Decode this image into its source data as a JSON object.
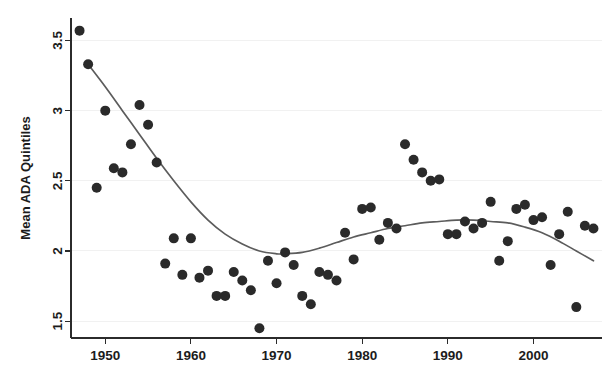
{
  "chart_data": {
    "type": "scatter",
    "title": "",
    "xlabel": "",
    "ylabel": "Mean ADA Quintiles",
    "xlim": [
      1946,
      2008
    ],
    "ylim": [
      1.38,
      3.66
    ],
    "xticks": [
      1950,
      1960,
      1970,
      1980,
      1990,
      2000
    ],
    "xtick_labels": [
      "1950",
      "1960",
      "1970",
      "1980",
      "1990",
      "2000"
    ],
    "yticks": [
      1.5,
      2,
      2.5,
      3,
      3.5
    ],
    "ytick_labels": [
      "1.5",
      "2",
      "2.5",
      "3",
      "3.5"
    ],
    "grid": true,
    "grid_axis": "y",
    "legend": "none",
    "marker_color": "#2a2a2a",
    "marker_size": 5.0,
    "fit_curve_color": "#5c5c5c",
    "fit_curve_label": "smoothed polynomial fit",
    "x": [
      1947,
      1948,
      1949,
      1950,
      1951,
      1952,
      1953,
      1954,
      1955,
      1956,
      1957,
      1958,
      1959,
      1960,
      1961,
      1962,
      1963,
      1964,
      1965,
      1966,
      1967,
      1968,
      1969,
      1970,
      1971,
      1972,
      1973,
      1974,
      1975,
      1976,
      1977,
      1978,
      1979,
      1980,
      1981,
      1982,
      1983,
      1984,
      1985,
      1986,
      1987,
      1988,
      1989,
      1990,
      1991,
      1992,
      1993,
      1994,
      1995,
      1996,
      1997,
      1998,
      1999,
      2000,
      2001,
      2002,
      2003,
      2004,
      2005,
      2006,
      2007
    ],
    "y": [
      3.57,
      3.33,
      2.45,
      3.0,
      2.59,
      2.56,
      2.76,
      3.04,
      2.9,
      2.63,
      1.91,
      2.09,
      1.83,
      2.09,
      1.81,
      1.86,
      1.68,
      1.68,
      1.85,
      1.79,
      1.72,
      1.45,
      1.93,
      1.77,
      1.99,
      1.9,
      1.68,
      1.62,
      1.85,
      1.83,
      1.79,
      2.13,
      1.94,
      2.3,
      2.31,
      2.08,
      2.2,
      2.16,
      2.76,
      2.65,
      2.56,
      2.5,
      2.51,
      2.12,
      2.12,
      2.21,
      2.16,
      2.2,
      2.35,
      1.93,
      2.07,
      2.3,
      2.33,
      2.22,
      2.24,
      1.9,
      2.12,
      2.28,
      1.6,
      2.18,
      2.16
    ],
    "fit_x": [
      1948,
      1950,
      1952,
      1954,
      1956,
      1958,
      1960,
      1962,
      1964,
      1966,
      1968,
      1970,
      1971,
      1973,
      1975,
      1977,
      1979,
      1981,
      1983,
      1985,
      1987,
      1989,
      1991,
      1993,
      1995,
      1997,
      1999,
      2001,
      2003,
      2005,
      2007
    ],
    "fit_y": [
      3.33,
      3.17,
      3.0,
      2.83,
      2.66,
      2.5,
      2.35,
      2.22,
      2.12,
      2.05,
      2.0,
      1.98,
      1.98,
      1.99,
      2.02,
      2.06,
      2.1,
      2.13,
      2.16,
      2.18,
      2.2,
      2.21,
      2.22,
      2.22,
      2.21,
      2.2,
      2.17,
      2.13,
      2.07,
      2.0,
      1.93
    ]
  }
}
